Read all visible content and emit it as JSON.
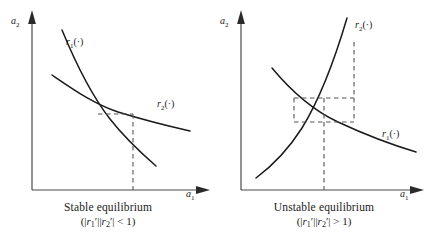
{
  "figure": {
    "kind": "two-panel reaction-function diagram",
    "stroke_color": "#1a1a1a",
    "dash_color": "#555555",
    "axis_color": "#4a4a4a"
  },
  "panels": [
    {
      "id": "stable",
      "y_axis_label": "a",
      "y_axis_subscript": "2",
      "x_axis_label": "a",
      "x_axis_subscript": "1",
      "curves": [
        {
          "name": "r1",
          "label_base": "r",
          "label_sub": "1",
          "label_arg": "(·)",
          "shape": "steep decreasing convex"
        },
        {
          "name": "r2",
          "label_base": "r",
          "label_sub": "2",
          "label_arg": "(·)",
          "shape": "shallow decreasing convex"
        }
      ],
      "caption_line1": "Stable equilibrium",
      "caption_math": {
        "open": "(|",
        "r1": "r",
        "r1_sub": "1",
        "r1_prime": "′",
        "mid": "||",
        "r2": "r",
        "r2_sub": "2",
        "r2_prime": "′",
        "close_abs": "|",
        "relation": "< 1",
        "close": ")"
      },
      "dashed_guides": "short horizontal segment from intersection plus vertical drop to the a1 axis"
    },
    {
      "id": "unstable",
      "y_axis_label": "a",
      "y_axis_subscript": "2",
      "x_axis_label": "a",
      "x_axis_subscript": "1",
      "curves": [
        {
          "name": "r2",
          "label_base": "r",
          "label_sub": "2",
          "label_arg": "(·)",
          "shape": "steep increasing convex"
        },
        {
          "name": "r1",
          "label_base": "r",
          "label_sub": "1",
          "label_arg": "(·)",
          "shape": "decreasing convex"
        }
      ],
      "caption_line1": "Unstable equilibrium",
      "caption_math": {
        "open": "(|",
        "r1": "r",
        "r1_sub": "1",
        "r1_prime": "′",
        "mid": "||",
        "r2": "r",
        "r2_sub": "2",
        "r2_prime": "′",
        "close_abs": "|",
        "relation": "> 1",
        "close": ")"
      },
      "dashed_guides": "cobweb staircase box around the intersection with a vertical drop to the a1 axis"
    }
  ]
}
